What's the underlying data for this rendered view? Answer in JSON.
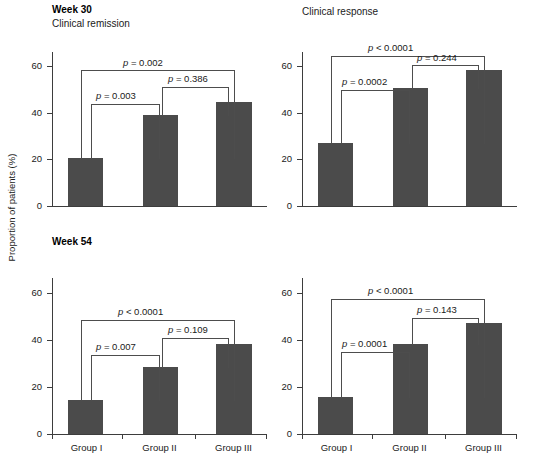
{
  "axis_title": "Proportion of patients (%)",
  "chart_data": {
    "type": "bar",
    "xlabel": "",
    "ylabel": "Proportion of patients (%)",
    "ylim": [
      0,
      70
    ],
    "yticks": [
      0,
      20,
      40,
      60
    ],
    "grid": false,
    "legend": "none",
    "bar_color": "#4b4b4b",
    "categories": [
      "Group I",
      "Group II",
      "Group III"
    ],
    "panels": [
      {
        "row_label": "Week 30",
        "subtitle": "Clinical remission",
        "values": [
          20.8,
          39.2,
          44.9
        ],
        "annotations": [
          {
            "text": "p = 0.003",
            "from": "Group I",
            "to": "Group II"
          },
          {
            "text": "p = 0.386",
            "from": "Group II",
            "to": "Group III"
          },
          {
            "text": "p = 0.002",
            "from": "Group I",
            "to": "Group III"
          }
        ]
      },
      {
        "row_label": "",
        "subtitle": "Clinical response",
        "values": [
          27.2,
          50.9,
          58.9
        ],
        "annotations": [
          {
            "text": "p = 0.0002",
            "from": "Group I",
            "to": "Group II"
          },
          {
            "text": "p = 0.244",
            "from": "Group II",
            "to": "Group III"
          },
          {
            "text": "p < 0.0001",
            "from": "Group I",
            "to": "Group III"
          }
        ]
      },
      {
        "row_label": "Week 54",
        "subtitle": "",
        "values": [
          14.6,
          28.9,
          38.6
        ],
        "annotations": [
          {
            "text": "p = 0.007",
            "from": "Group I",
            "to": "Group II"
          },
          {
            "text": "p = 0.109",
            "from": "Group II",
            "to": "Group III"
          },
          {
            "text": "p < 0.0001",
            "from": "Group I",
            "to": "Group III"
          }
        ]
      },
      {
        "row_label": "",
        "subtitle": "",
        "values": [
          16.0,
          38.4,
          47.5
        ],
        "annotations": [
          {
            "text": "p = 0.0001",
            "from": "Group I",
            "to": "Group II"
          },
          {
            "text": "p = 0.143",
            "from": "Group II",
            "to": "Group III"
          },
          {
            "text": "p < 0.0001",
            "from": "Group I",
            "to": "Group III"
          }
        ]
      }
    ]
  },
  "panel_tl": {
    "week": "Week 30",
    "subtitle": "Clinical remission",
    "yticks": [
      "60",
      "40",
      "20",
      "0"
    ],
    "xcats": [
      "Group I",
      "Group II",
      "Group III"
    ],
    "p_12": "p = 0.003",
    "p_23": "p = 0.386",
    "p_13": "p = 0.002"
  },
  "panel_tr": {
    "week": "",
    "subtitle": "Clinical response",
    "yticks": [
      "60",
      "40",
      "20",
      "0"
    ],
    "xcats": [
      "Group I",
      "Group II",
      "Group III"
    ],
    "p_12": "p = 0.0002",
    "p_23": "p = 0.244",
    "p_13": "p < 0.0001"
  },
  "panel_bl": {
    "week": "Week 54",
    "subtitle": "",
    "yticks": [
      "60",
      "40",
      "20",
      "0"
    ],
    "xcats": [
      "Group I",
      "Group II",
      "Group III"
    ],
    "p_12": "p = 0.007",
    "p_23": "p = 0.109",
    "p_13": "p < 0.0001"
  },
  "panel_br": {
    "week": "",
    "subtitle": "",
    "yticks": [
      "60",
      "40",
      "20",
      "0"
    ],
    "xcats": [
      "Group I",
      "Group II",
      "Group III"
    ],
    "p_12": "p = 0.0001",
    "p_23": "p = 0.143",
    "p_13": "p < 0.0001"
  }
}
